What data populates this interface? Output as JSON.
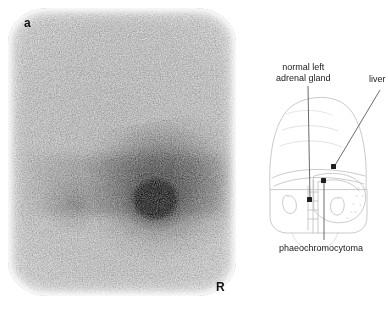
{
  "figure": {
    "panel_letter": "a",
    "orientation_marker": "R"
  },
  "scan": {
    "modality_label": "a",
    "side_marker": "R"
  },
  "diagram": {
    "labels": {
      "adrenal_line1": "normal left",
      "adrenal_line2": "adrenal gland",
      "liver": "liver",
      "tumour": "phaeochromocytoma"
    }
  },
  "colors": {
    "background": "#ffffff",
    "text": "#1a1a1a",
    "leader_line": "#555555",
    "marker_dot": "#1a1a1a",
    "sketch_line": "#b9b9b9",
    "hotspot": "#0a0a0a"
  }
}
